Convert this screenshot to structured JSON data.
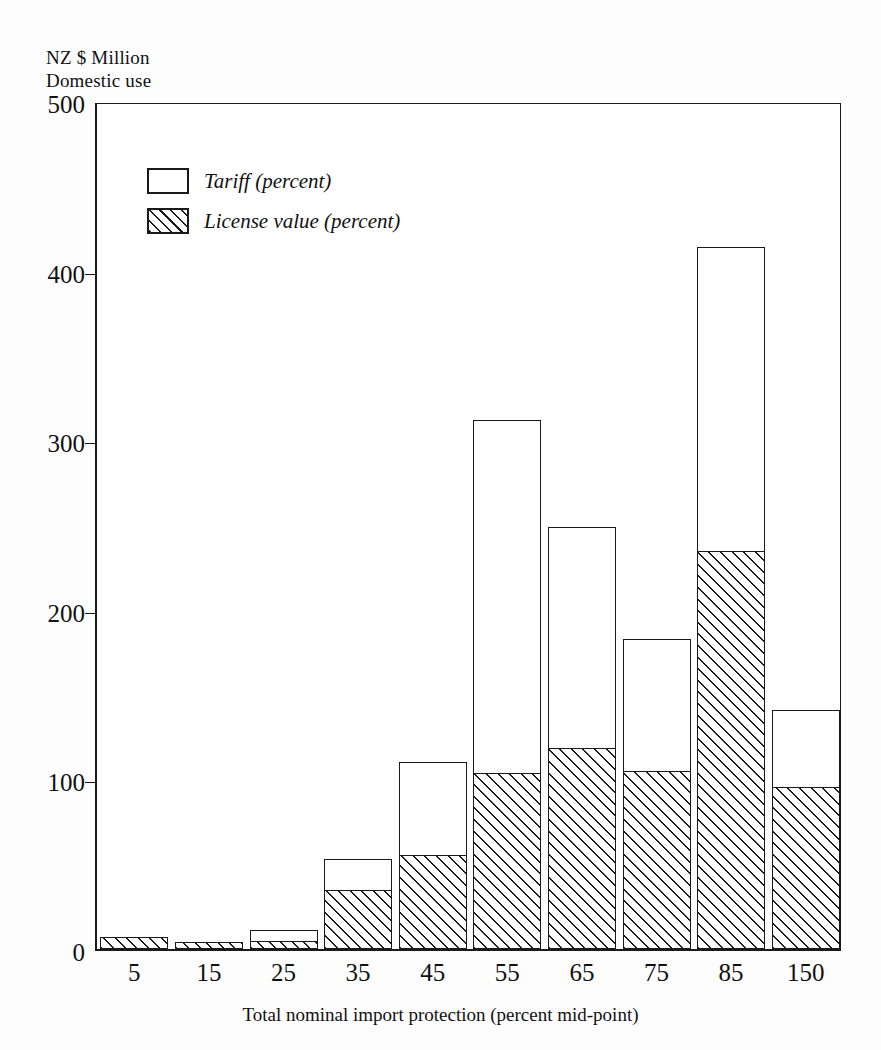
{
  "chart_data": {
    "type": "bar",
    "title": "",
    "ylabel": "NZ $ Million\nDomestic use",
    "xlabel": "Total nominal import protection (percent mid-point)",
    "categories": [
      "5",
      "15",
      "25",
      "35",
      "45",
      "55",
      "65",
      "75",
      "85",
      "150"
    ],
    "series": [
      {
        "name": "License value (percent)",
        "values": [
          7,
          4,
          5,
          35,
          56,
          104,
          119,
          105,
          235,
          96
        ]
      },
      {
        "name": "Tariff (percent)",
        "values": [
          0,
          0,
          6,
          18,
          54,
          208,
          130,
          78,
          179,
          45
        ]
      }
    ],
    "totals": [
      7,
      4,
      11,
      53,
      110,
      312,
      249,
      183,
      414,
      141
    ],
    "stacked": true,
    "stack_order_bottom_to_top": [
      "License value (percent)",
      "Tariff (percent)"
    ],
    "ylim": [
      0,
      500
    ],
    "yticks": [
      0,
      100,
      200,
      300,
      400,
      500
    ],
    "ytick_labels": [
      "0",
      "100",
      "200",
      "300",
      "400",
      "500"
    ],
    "grid": false,
    "legend_position": "inside-top-left",
    "legend": [
      {
        "label": "Tariff (percent)",
        "swatch": "white-outline"
      },
      {
        "label": "License value (percent)",
        "swatch": "diagonal-hatch"
      }
    ],
    "colors": {
      "outline": "#1a1a1a",
      "tariff_fill": "#ffffff",
      "license_hatch": "#1a1a1a",
      "background": "#ffffff"
    }
  }
}
